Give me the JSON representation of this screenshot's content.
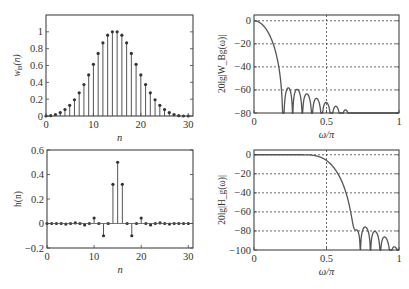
{
  "chart_data": [
    {
      "id": "wB",
      "type": "stem",
      "ylabel": "w_B(n)",
      "ylabel_main": "w",
      "ylabel_sub": "B",
      "ylabel_tail": "(n)",
      "xlabel": "n",
      "xlim": [
        0,
        31
      ],
      "ylim": [
        0,
        1.2
      ],
      "xticks": [
        0,
        10,
        20,
        30
      ],
      "yticks": [
        0,
        0.2,
        0.4,
        0.6,
        0.8,
        1
      ],
      "ytick_labels": [
        "0",
        "0.2",
        "0.4",
        "0.6",
        "0.8",
        "1"
      ],
      "grid": false,
      "x": [
        0,
        1,
        2,
        3,
        4,
        5,
        6,
        7,
        8,
        9,
        10,
        11,
        12,
        13,
        14,
        15,
        16,
        17,
        18,
        19,
        20,
        21,
        22,
        23,
        24,
        25,
        26,
        27,
        28,
        29,
        30
      ],
      "values": [
        0.0,
        0.004,
        0.017,
        0.041,
        0.077,
        0.127,
        0.193,
        0.275,
        0.374,
        0.488,
        0.614,
        0.744,
        0.87,
        0.96,
        1.0,
        1.0,
        0.96,
        0.87,
        0.744,
        0.614,
        0.488,
        0.374,
        0.275,
        0.193,
        0.127,
        0.077,
        0.041,
        0.017,
        0.004,
        0.0,
        0.0
      ],
      "box": {
        "x0": 46,
        "y0": 15,
        "x1": 193,
        "y1": 116
      }
    },
    {
      "id": "WgdB",
      "type": "line",
      "ylabel": "20lg|W_Bg(ω)|",
      "xlabel": "ω/π",
      "xlim": [
        0,
        1
      ],
      "ylim": [
        -80,
        5
      ],
      "xticks": [
        0,
        0.5,
        1
      ],
      "xtick_labels": [
        "0",
        "0.5",
        "1"
      ],
      "yticks": [
        0,
        -20,
        -40,
        -60,
        -80
      ],
      "ytick_labels": [
        "0",
        "−20",
        "−40",
        "−60",
        "−80"
      ],
      "grid": true,
      "curve": "blackman_window_db",
      "mainlobe_edge": 0.2,
      "sidelobe_peak_db": -58,
      "box": {
        "x0": 254,
        "y0": 15,
        "x1": 399,
        "y1": 113
      }
    },
    {
      "id": "h",
      "type": "stem",
      "ylabel": "h(n)",
      "xlabel": "n",
      "xlim": [
        0,
        31
      ],
      "ylim": [
        -0.2,
        0.6
      ],
      "xticks": [
        0,
        10,
        20,
        30
      ],
      "yticks": [
        -0.2,
        0,
        0.2,
        0.4,
        0.6
      ],
      "ytick_labels": [
        "−0.2",
        "0",
        "0.2",
        "0.4",
        "0.6"
      ],
      "grid": false,
      "x": [
        0,
        1,
        2,
        3,
        4,
        5,
        6,
        7,
        8,
        9,
        10,
        11,
        12,
        13,
        14,
        15,
        16,
        17,
        18,
        19,
        20,
        21,
        22,
        23,
        24,
        25,
        26,
        27,
        28,
        29,
        30
      ],
      "values": [
        0,
        0,
        0,
        0,
        -0.005,
        0,
        0.005,
        0,
        -0.012,
        0,
        0.045,
        0,
        -0.1,
        0,
        0.32,
        0.5,
        0.32,
        0,
        -0.1,
        0,
        0.045,
        0,
        -0.012,
        0,
        0.005,
        0,
        -0.005,
        0,
        0,
        0,
        0
      ],
      "box": {
        "x0": 47,
        "y0": 150,
        "x1": 193,
        "y1": 248
      }
    },
    {
      "id": "HgdB",
      "type": "line",
      "ylabel": "20lg|H_g(ω)|",
      "xlabel": "ω/π",
      "xlim": [
        0,
        1
      ],
      "ylim": [
        -100,
        5
      ],
      "xticks": [
        0,
        0.5,
        1
      ],
      "xtick_labels": [
        "0",
        "0.5",
        "1"
      ],
      "yticks": [
        0,
        -20,
        -40,
        -60,
        -80,
        -100
      ],
      "ytick_labels": [
        "0",
        "−20",
        "−40",
        "−60",
        "−80",
        "−100"
      ],
      "grid": true,
      "curve": "lowpass_blackman_db",
      "cutoff": 0.5,
      "stopband_edge": 0.73,
      "box": {
        "x0": 254,
        "y0": 150,
        "x1": 399,
        "y1": 250
      }
    }
  ],
  "style": {
    "line_color": "#555555",
    "axis_color": "#444444",
    "grid_color": "#444444",
    "text_color": "#333333"
  }
}
